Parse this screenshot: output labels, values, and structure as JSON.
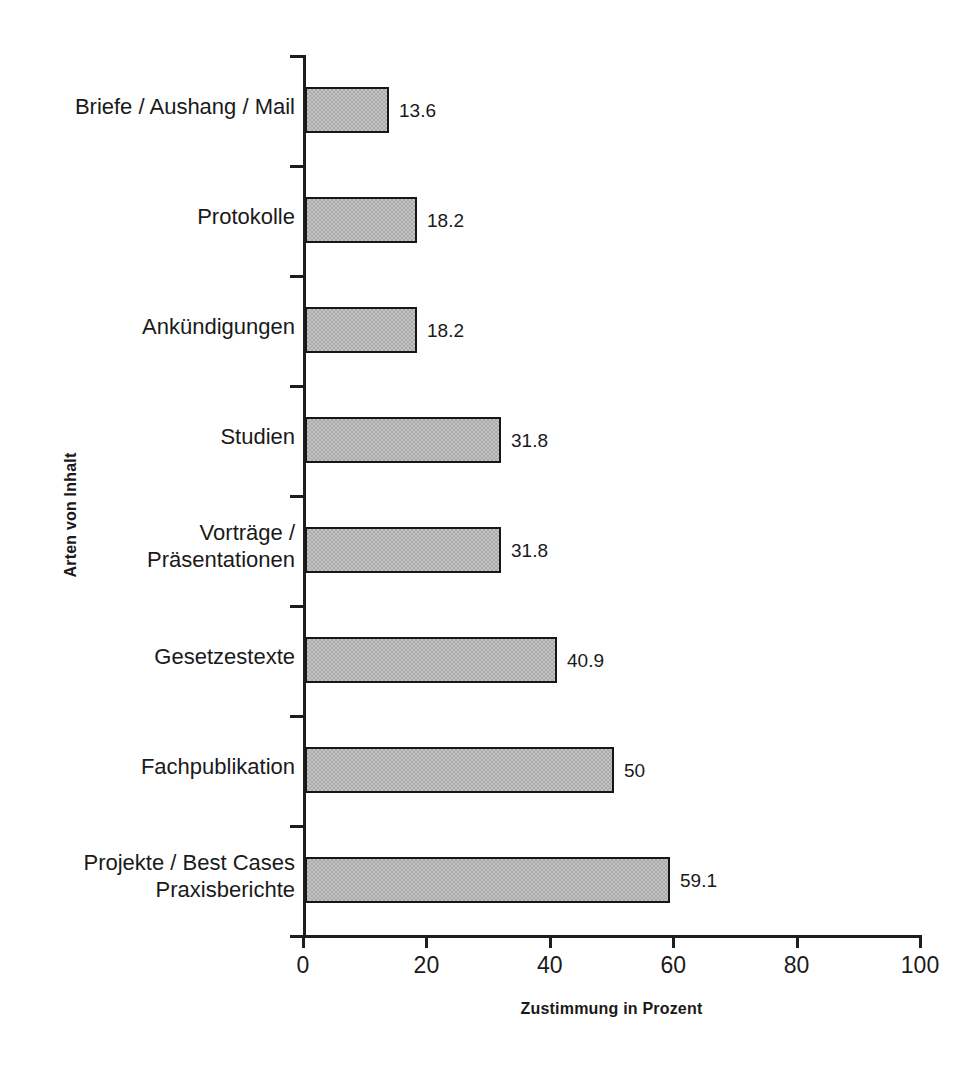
{
  "chart_data": {
    "type": "bar",
    "orientation": "horizontal",
    "title": "",
    "xlabel": "Zustimmung in Prozent",
    "ylabel": "Arten von Inhalt",
    "xlim": [
      0,
      100
    ],
    "xticks": [
      "0",
      "20",
      "40",
      "60",
      "80",
      "100"
    ],
    "xtick_values": [
      0,
      20,
      40,
      60,
      80,
      100
    ],
    "grid": false,
    "legend": null,
    "categories": [
      "Briefe / Aushang / Mail",
      "Protokolle",
      "Ankündigungen",
      "Studien",
      "Vorträge /\nPräsentationen",
      "Gesetzestexte",
      "Fachpublikation",
      "Projekte / Best Cases\nPraxisberichte"
    ],
    "values": [
      13.6,
      18.2,
      18.2,
      31.8,
      31.8,
      40.9,
      50,
      59.1
    ],
    "value_labels": [
      "13.6",
      "18.2",
      "18.2",
      "31.8",
      "31.8",
      "40.9",
      "50",
      "59.1"
    ],
    "bar_fill_color": "#a9a9a9",
    "bar_border_color": "#161616",
    "axis_color": "#1d1d1d",
    "background_color": "#ffffff"
  }
}
